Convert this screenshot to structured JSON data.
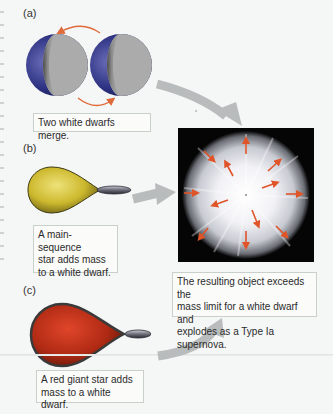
{
  "figure": {
    "panels": [
      {
        "id": "a",
        "label": "(a)",
        "caption": "Two white dwarfs merge."
      },
      {
        "id": "b",
        "label": "(b)",
        "caption_lines": [
          "A main-sequence",
          "star adds mass",
          "to a white dwarf."
        ]
      },
      {
        "id": "c",
        "label": "(c)",
        "caption_lines": [
          "A red giant star adds",
          "mass to a white dwarf."
        ]
      }
    ],
    "result": {
      "caption_lines": [
        "The resulting object exceeds the",
        "mass limit for a white dwarf and",
        "explodes as a Type Ia supernova."
      ]
    },
    "colors": {
      "white_dwarf_shadow": "#2a2f7a",
      "white_dwarf_light": "#a9a9a9",
      "orbit_arrow": "#e06a3a",
      "main_sequence_star": "#d6c43a",
      "red_giant_star": "#c0301a",
      "flow_arrow": "#b9bcbc",
      "supernova_bg": "#050505",
      "expansion_arrow": "#e0542a"
    },
    "icons": {
      "orbit_arrows": "curved-arrow",
      "flow_arrows": "gray-arrow",
      "expansion_arrows": "radial-arrow"
    }
  }
}
